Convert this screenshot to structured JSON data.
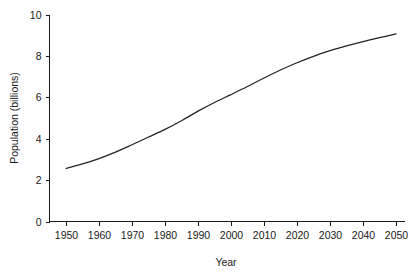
{
  "chart_data": {
    "type": "line",
    "title": "",
    "xlabel": "Year",
    "ylabel": "Population (billions)",
    "xlim": [
      1945,
      2052
    ],
    "ylim": [
      0,
      10
    ],
    "grid": false,
    "legend": null,
    "x_ticks": [
      1950,
      1960,
      1970,
      1980,
      1990,
      2000,
      2010,
      2020,
      2030,
      2040,
      2050
    ],
    "x_tick_labels": [
      "1950",
      "1960",
      "1970",
      "1980",
      "1990",
      "2000",
      "2010",
      "2020",
      "2030",
      "2040",
      "2050"
    ],
    "y_ticks": [
      0,
      2,
      4,
      6,
      8,
      10
    ],
    "y_tick_labels": [
      "0",
      "2",
      "4",
      "6",
      "8",
      "10"
    ],
    "series": [
      {
        "name": "World population",
        "color": "#232323",
        "x": [
          1950,
          1955,
          1960,
          1965,
          1970,
          1975,
          1980,
          1985,
          1990,
          1995,
          2000,
          2005,
          2010,
          2015,
          2020,
          2025,
          2030,
          2035,
          2040,
          2045,
          2050
        ],
        "values": [
          2.56,
          2.78,
          3.04,
          3.35,
          3.71,
          4.08,
          4.45,
          4.87,
          5.33,
          5.75,
          6.13,
          6.52,
          6.93,
          7.32,
          7.67,
          7.98,
          8.25,
          8.48,
          8.69,
          8.88,
          9.06
        ]
      }
    ]
  },
  "axes": {
    "x_axis_name": "year-axis",
    "y_axis_name": "population-axis"
  }
}
